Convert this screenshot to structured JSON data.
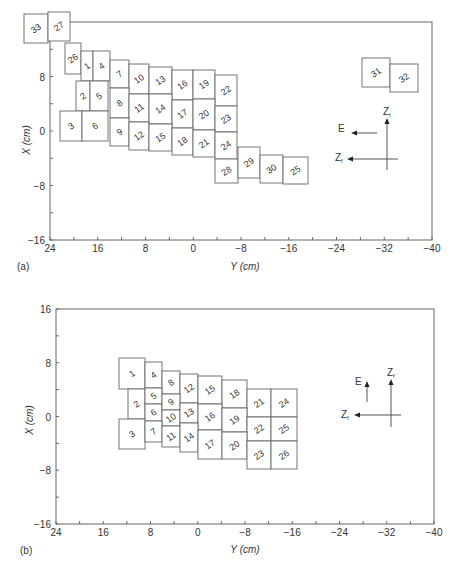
{
  "chart_data": [
    {
      "type": "diagram",
      "panel_label": "(a)",
      "xlabel": "Y (cm)",
      "ylabel": "X (cm)",
      "xticks": [
        "24",
        "16",
        "8",
        "0",
        "−8",
        "−16",
        "−24",
        "−32",
        "−40"
      ],
      "yticks": [
        "16",
        "8",
        "0",
        "−8",
        "−16"
      ],
      "xlim": [
        24,
        -40
      ],
      "ylim": [
        -16,
        16
      ],
      "cells": [
        {
          "n": "33",
          "x": 24,
          "y": 14,
          "w": 24,
          "h": 29
        },
        {
          "n": "27",
          "x": 48,
          "y": 12,
          "w": 22,
          "h": 29
        },
        {
          "n": "26",
          "x": 65,
          "y": 43,
          "w": 16,
          "h": 31
        },
        {
          "n": "1",
          "x": 81,
          "y": 51,
          "w": 12,
          "h": 30
        },
        {
          "n": "4",
          "x": 93,
          "y": 51,
          "w": 17,
          "h": 30
        },
        {
          "n": "7",
          "x": 110,
          "y": 60,
          "w": 19,
          "h": 28
        },
        {
          "n": "10",
          "x": 129,
          "y": 64,
          "w": 20,
          "h": 30
        },
        {
          "n": "13",
          "x": 149,
          "y": 67,
          "w": 23,
          "h": 27
        },
        {
          "n": "16",
          "x": 172,
          "y": 70,
          "w": 21,
          "h": 30
        },
        {
          "n": "19",
          "x": 193,
          "y": 70,
          "w": 22,
          "h": 29
        },
        {
          "n": "22",
          "x": 215,
          "y": 75,
          "w": 22,
          "h": 31
        },
        {
          "n": "2",
          "x": 76,
          "y": 81,
          "w": 14,
          "h": 30
        },
        {
          "n": "5",
          "x": 90,
          "y": 81,
          "w": 18,
          "h": 30
        },
        {
          "n": "8",
          "x": 110,
          "y": 88,
          "w": 19,
          "h": 30
        },
        {
          "n": "11",
          "x": 129,
          "y": 94,
          "w": 20,
          "h": 28
        },
        {
          "n": "14",
          "x": 149,
          "y": 94,
          "w": 23,
          "h": 30
        },
        {
          "n": "17",
          "x": 172,
          "y": 100,
          "w": 21,
          "h": 28
        },
        {
          "n": "20",
          "x": 193,
          "y": 99,
          "w": 22,
          "h": 31
        },
        {
          "n": "23",
          "x": 215,
          "y": 106,
          "w": 22,
          "h": 26
        },
        {
          "n": "3",
          "x": 60,
          "y": 111,
          "w": 22,
          "h": 30
        },
        {
          "n": "6",
          "x": 82,
          "y": 111,
          "w": 26,
          "h": 30
        },
        {
          "n": "9",
          "x": 110,
          "y": 118,
          "w": 19,
          "h": 28
        },
        {
          "n": "12",
          "x": 129,
          "y": 122,
          "w": 20,
          "h": 28
        },
        {
          "n": "15",
          "x": 149,
          "y": 124,
          "w": 23,
          "h": 27
        },
        {
          "n": "18",
          "x": 172,
          "y": 128,
          "w": 21,
          "h": 27
        },
        {
          "n": "21",
          "x": 193,
          "y": 130,
          "w": 22,
          "h": 27
        },
        {
          "n": "24",
          "x": 215,
          "y": 132,
          "w": 22,
          "h": 27
        },
        {
          "n": "28",
          "x": 215,
          "y": 159,
          "w": 23,
          "h": 24
        },
        {
          "n": "29",
          "x": 238,
          "y": 147,
          "w": 22,
          "h": 31
        },
        {
          "n": "30",
          "x": 260,
          "y": 155,
          "w": 23,
          "h": 28
        },
        {
          "n": "25",
          "x": 283,
          "y": 157,
          "w": 25,
          "h": 27
        },
        {
          "n": "31",
          "x": 362,
          "y": 58,
          "w": 28,
          "h": 29
        },
        {
          "n": "32",
          "x": 390,
          "y": 64,
          "w": 28,
          "h": 28
        }
      ],
      "legend": {
        "E": "E",
        "Zf_up": "Z",
        "Zf_left": "Z",
        "subscript": "f"
      }
    },
    {
      "type": "diagram",
      "panel_label": "(b)",
      "xlabel": "Y (cm)",
      "ylabel": "X (cm)",
      "xticks": [
        "24",
        "16",
        "8",
        "0",
        "−8",
        "−16",
        "−24",
        "−32",
        "−40"
      ],
      "yticks": [
        "16",
        "8",
        "0",
        "−8",
        "−16"
      ],
      "xlim": [
        24,
        -40
      ],
      "ylim": [
        -16,
        16
      ],
      "cells": [
        {
          "n": "1",
          "x": 119,
          "y": 358,
          "w": 26,
          "h": 31
        },
        {
          "n": "4",
          "x": 145,
          "y": 362,
          "w": 17,
          "h": 26
        },
        {
          "n": "8",
          "x": 162,
          "y": 371,
          "w": 18,
          "h": 23
        },
        {
          "n": "12",
          "x": 180,
          "y": 374,
          "w": 18,
          "h": 29
        },
        {
          "n": "15",
          "x": 198,
          "y": 376,
          "w": 24,
          "h": 28
        },
        {
          "n": "18",
          "x": 222,
          "y": 380,
          "w": 25,
          "h": 28
        },
        {
          "n": "21",
          "x": 247,
          "y": 389,
          "w": 24,
          "h": 28
        },
        {
          "n": "24",
          "x": 271,
          "y": 389,
          "w": 26,
          "h": 28
        },
        {
          "n": "2",
          "x": 128,
          "y": 389,
          "w": 17,
          "h": 30
        },
        {
          "n": "5",
          "x": 145,
          "y": 388,
          "w": 17,
          "h": 16
        },
        {
          "n": "6",
          "x": 145,
          "y": 404,
          "w": 17,
          "h": 17
        },
        {
          "n": "9",
          "x": 162,
          "y": 394,
          "w": 18,
          "h": 16
        },
        {
          "n": "10",
          "x": 162,
          "y": 410,
          "w": 18,
          "h": 16
        },
        {
          "n": "13",
          "x": 180,
          "y": 403,
          "w": 18,
          "h": 20
        },
        {
          "n": "16",
          "x": 198,
          "y": 404,
          "w": 24,
          "h": 26
        },
        {
          "n": "19",
          "x": 222,
          "y": 408,
          "w": 25,
          "h": 24
        },
        {
          "n": "22",
          "x": 247,
          "y": 417,
          "w": 24,
          "h": 24
        },
        {
          "n": "25",
          "x": 271,
          "y": 417,
          "w": 26,
          "h": 24
        },
        {
          "n": "3",
          "x": 119,
          "y": 419,
          "w": 26,
          "h": 30
        },
        {
          "n": "7",
          "x": 145,
          "y": 421,
          "w": 17,
          "h": 21
        },
        {
          "n": "11",
          "x": 162,
          "y": 426,
          "w": 18,
          "h": 21
        },
        {
          "n": "14",
          "x": 180,
          "y": 423,
          "w": 18,
          "h": 29
        },
        {
          "n": "17",
          "x": 198,
          "y": 430,
          "w": 24,
          "h": 29
        },
        {
          "n": "20",
          "x": 222,
          "y": 432,
          "w": 25,
          "h": 27
        },
        {
          "n": "23",
          "x": 247,
          "y": 441,
          "w": 24,
          "h": 28
        },
        {
          "n": "26",
          "x": 271,
          "y": 441,
          "w": 26,
          "h": 28
        }
      ],
      "legend": {
        "E": "E",
        "Zf_up": "Z",
        "Zf_left": "Z",
        "subscript": "f"
      }
    }
  ]
}
